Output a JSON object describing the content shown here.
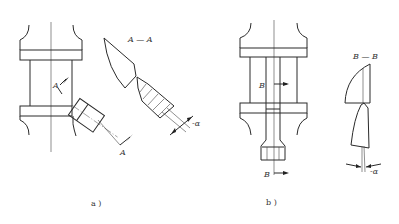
{
  "figure": {
    "subfigures": [
      {
        "id": "a",
        "caption": "a )",
        "section_title": "A — A",
        "section_marks": [
          "A",
          "A"
        ],
        "angle_label": "-α",
        "description": "Angled cutting tool mounted on broach/shaft with section A-A showing wedge tooth geometry"
      },
      {
        "id": "b",
        "caption": "b )",
        "section_title": "B — B",
        "section_marks": [
          "B",
          "B"
        ],
        "angle_label": "-α",
        "description": "Straight tool inserted along axis with hex end and section B-B showing tooth geometry"
      }
    ]
  }
}
